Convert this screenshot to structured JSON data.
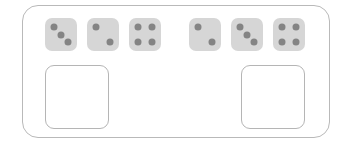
{
  "panel": {
    "name": "dice-comparison-panel",
    "border_color": "#b9b9b9",
    "background_color": "#ffffff"
  },
  "dice": {
    "face_color": "#d6d6d6",
    "pip_color": "#848484",
    "groups": [
      {
        "group_label": "left-dice-group",
        "items": [
          {
            "value": 3,
            "pips": [
              "p-tl",
              "p-c",
              "p-br"
            ]
          },
          {
            "value": 2,
            "pips": [
              "p-tl",
              "p-br"
            ]
          },
          {
            "value": 4,
            "pips": [
              "p-tl",
              "p-tr",
              "p-bl",
              "p-br"
            ]
          }
        ],
        "total": 9
      },
      {
        "group_label": "right-dice-group",
        "items": [
          {
            "value": 2,
            "pips": [
              "p-tl",
              "p-br"
            ]
          },
          {
            "value": 3,
            "pips": [
              "p-tl",
              "p-c",
              "p-br"
            ]
          },
          {
            "value": 4,
            "pips": [
              "p-tl",
              "p-tr",
              "p-bl",
              "p-br"
            ]
          }
        ],
        "total": 9
      }
    ]
  },
  "slots": {
    "border_color": "#b5b5b5",
    "background_color": "#ffffff",
    "items": [
      {
        "label": "",
        "name": "answer-slot-left"
      },
      {
        "label": "",
        "name": "answer-slot-right"
      }
    ]
  }
}
